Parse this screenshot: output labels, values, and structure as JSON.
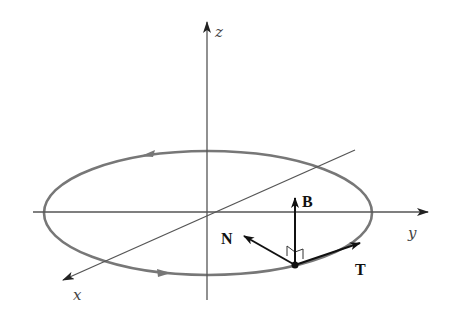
{
  "diagram": {
    "axes": {
      "x": {
        "label": "x"
      },
      "y": {
        "label": "y"
      },
      "z": {
        "label": "z"
      }
    },
    "vectors": {
      "tangent": {
        "label": "T"
      },
      "normal": {
        "label": "N"
      },
      "binormal": {
        "label": "B"
      }
    },
    "colors": {
      "axis": "#555555",
      "curve": "#777777",
      "vector": "#111111",
      "background": "#ffffff"
    }
  }
}
